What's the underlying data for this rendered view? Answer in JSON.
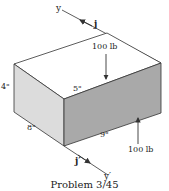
{
  "figure": {
    "caption": "Problem 3/45",
    "axes": {
      "y_label": "y",
      "j_label": "j",
      "y_prime_label": "y′",
      "j_prime_label": "j′"
    },
    "dimensions": {
      "height": "4\"",
      "depth": "8\"",
      "top_offset": "5\"",
      "length": "9\""
    },
    "forces": {
      "top_force": "100 lb",
      "bottom_force": "100 lb"
    },
    "colors": {
      "top_face": "#ffffff",
      "left_face": "#dcdcdc",
      "front_face": "#a9a9a9",
      "line": "#333333"
    }
  }
}
